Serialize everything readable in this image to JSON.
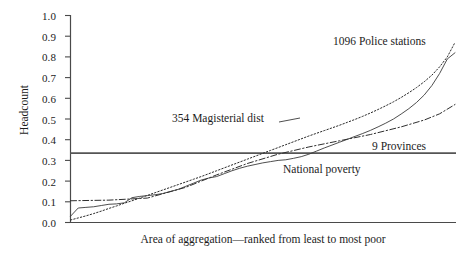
{
  "chart_data": {
    "type": "line",
    "title": "",
    "xlabel": "Area of aggregation—ranked from least to most poor",
    "ylabel": "Headcount",
    "ylim": [
      0.0,
      1.0
    ],
    "xlim": [
      0,
      100
    ],
    "grid": false,
    "legend_position": "inline-annotations",
    "ytick_labels": [
      "1.0",
      "0.9",
      "0.8",
      "0.7",
      "0.6",
      "0.5",
      "0.4",
      "0.3",
      "0.2",
      "0.1",
      "0.0"
    ],
    "ytick_values": [
      1.0,
      0.9,
      0.8,
      0.7,
      0.6,
      0.5,
      0.4,
      0.3,
      0.2,
      0.1,
      0.0
    ],
    "xtick_labels": [],
    "annotations": [
      {
        "name": "police-stations",
        "text": "1096  Police stations"
      },
      {
        "name": "magisterial-districts",
        "text": "354 Magisterial dist"
      },
      {
        "name": "provinces",
        "text": "9 Provinces"
      },
      {
        "name": "national-poverty",
        "text": "National poverty"
      }
    ],
    "reference_lines": [
      {
        "name": "national-poverty-line",
        "orientation": "horizontal",
        "value": 0.335,
        "label": "National poverty",
        "style": "solid",
        "color": "#555555"
      }
    ],
    "series": [
      {
        "name": "1096  Police stations",
        "style": "dotted",
        "color": "#2a2a2a",
        "x": [
          0,
          2,
          4,
          6,
          8,
          10,
          12,
          14,
          16,
          18,
          20,
          22,
          24,
          26,
          28,
          30,
          32,
          34,
          36,
          38,
          40,
          42,
          44,
          46,
          48,
          50,
          52,
          54,
          56,
          58,
          60,
          62,
          64,
          66,
          68,
          70,
          72,
          74,
          76,
          78,
          80,
          82,
          84,
          86,
          88,
          90,
          92,
          94,
          96,
          98,
          100
        ],
        "y": [
          0.012,
          0.022,
          0.032,
          0.043,
          0.055,
          0.068,
          0.08,
          0.093,
          0.105,
          0.118,
          0.131,
          0.144,
          0.157,
          0.17,
          0.183,
          0.196,
          0.209,
          0.222,
          0.236,
          0.25,
          0.264,
          0.278,
          0.292,
          0.306,
          0.32,
          0.334,
          0.348,
          0.362,
          0.376,
          0.39,
          0.404,
          0.418,
          0.431,
          0.444,
          0.457,
          0.47,
          0.484,
          0.498,
          0.513,
          0.529,
          0.546,
          0.564,
          0.583,
          0.604,
          0.627,
          0.652,
          0.68,
          0.712,
          0.752,
          0.8,
          0.87
        ]
      },
      {
        "name": "354 Magisterial dist",
        "style": "solid",
        "color": "#3a3a3a",
        "x": [
          0,
          2,
          4,
          6,
          8,
          10,
          12,
          14,
          16,
          18,
          20,
          22,
          24,
          26,
          28,
          30,
          32,
          34,
          36,
          38,
          40,
          42,
          44,
          46,
          48,
          50,
          52,
          54,
          56,
          58,
          60,
          62,
          64,
          66,
          68,
          70,
          72,
          74,
          76,
          78,
          80,
          82,
          84,
          86,
          88,
          90,
          92,
          94,
          96,
          98,
          100
        ],
        "y": [
          0.03,
          0.07,
          0.073,
          0.076,
          0.082,
          0.088,
          0.09,
          0.095,
          0.12,
          0.126,
          0.13,
          0.134,
          0.14,
          0.15,
          0.16,
          0.175,
          0.19,
          0.205,
          0.215,
          0.222,
          0.236,
          0.25,
          0.262,
          0.272,
          0.28,
          0.288,
          0.294,
          0.3,
          0.303,
          0.31,
          0.318,
          0.33,
          0.345,
          0.36,
          0.374,
          0.388,
          0.402,
          0.416,
          0.43,
          0.445,
          0.462,
          0.48,
          0.5,
          0.524,
          0.55,
          0.58,
          0.616,
          0.662,
          0.72,
          0.79,
          0.82
        ]
      },
      {
        "name": "9 Provinces",
        "style": "dash-dot",
        "color": "#2f2f2f",
        "x": [
          0,
          10,
          20,
          30,
          38,
          46,
          54,
          62,
          70,
          78,
          86,
          92,
          96,
          100
        ],
        "y": [
          0.105,
          0.108,
          0.118,
          0.17,
          0.23,
          0.285,
          0.33,
          0.365,
          0.395,
          0.425,
          0.462,
          0.495,
          0.525,
          0.57
        ]
      }
    ]
  },
  "axes": {
    "y_title": "Headcount",
    "x_title": "Area of aggregation—ranked from least to most poor",
    "y_ticks": [
      "1.0",
      "0.9",
      "0.8",
      "0.7",
      "0.6",
      "0.5",
      "0.4",
      "0.3",
      "0.2",
      "0.1",
      "0.0"
    ]
  },
  "labels": {
    "police_stations": "1096  Police stations",
    "magisterial_districts": "354 Magisterial dist",
    "provinces": "9 Provinces",
    "national_poverty": "National poverty"
  },
  "colors": {
    "background": "#ffffff",
    "axis": "#4a4a4a",
    "text": "#1c1c1c",
    "series_police": "#2a2a2a",
    "series_magisterial": "#3a3a3a",
    "series_provinces": "#2f2f2f",
    "reference_line": "#555555"
  }
}
